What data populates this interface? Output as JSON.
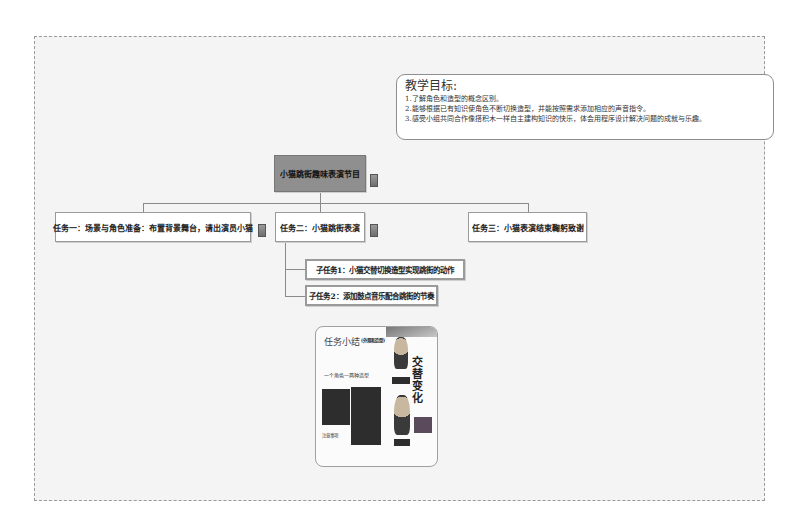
{
  "goal_box": {
    "title": "教学目标:",
    "lines": [
      "1.了解角色和造型的概念区别。",
      "2.能够根据已有知识使角色不断切换造型，并能按照需求添加相应的声音指令。",
      "3.感受小组共同合作像搭积木一样自主建构知识的快乐，体会用程序设计解决问题的成就与乐趣。"
    ]
  },
  "mindmap": {
    "root": "小猫跳街趣味表演节目",
    "tasks": [
      {
        "label": "任务一：场景与角色准备：布置背景舞台，请出演员小猫"
      },
      {
        "label": "任务二：小猫跳街表演"
      },
      {
        "label": "任务三：小猫表演结束鞠躬致谢"
      }
    ],
    "subtasks": [
      {
        "label": "子任务1：小猫交替切换造型实现跳街的动作"
      },
      {
        "label": "子任务2：添加鼓点音乐配合跳街的节奏"
      }
    ]
  },
  "thumbnail": {
    "title": "任务小结",
    "subtitle": "(外观和造型)",
    "label": "一个角色—两种造型",
    "side_text": "交替变化",
    "note": "注意事项"
  },
  "icons": {
    "note_icon": "note-icon"
  }
}
